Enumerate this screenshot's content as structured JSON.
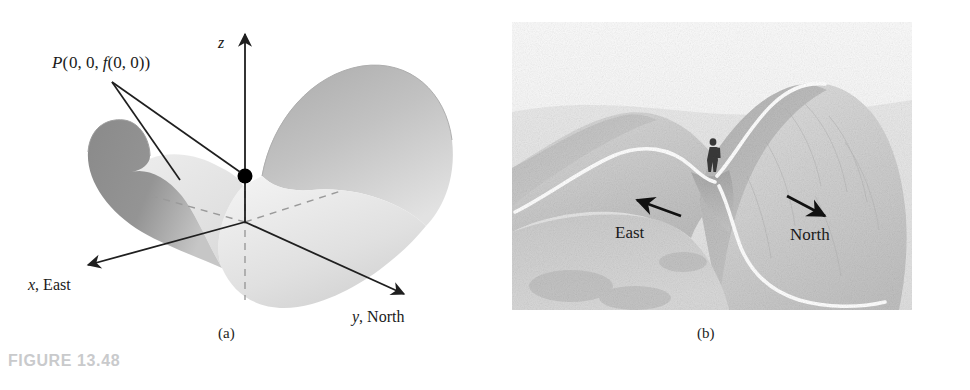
{
  "figure": {
    "caption": "FIGURE 13.48",
    "caption_color": "#c9cacc",
    "background": "#ffffff"
  },
  "panel_a": {
    "sublabel": "(a)",
    "description": "Three-dimensional saddle surface z = f(x, y) drawn over x-y-z axes with the saddle point P marked by a filled black dot.",
    "point_label": {
      "p": "P",
      "open_paren": "(",
      "args": "0, 0,",
      "f": "f",
      "f_args": "(0, 0)",
      "close_paren": ")",
      "full_text": "P(0, 0, f(0, 0))"
    },
    "axes": [
      {
        "name": "z-axis",
        "symbol": "z",
        "suffix": "",
        "direction": "up"
      },
      {
        "name": "x-axis",
        "symbol": "x",
        "suffix": ", East",
        "direction": "down-left"
      },
      {
        "name": "y-axis",
        "symbol": "y",
        "suffix": ", North",
        "direction": "down-right"
      }
    ],
    "surface": {
      "left_lobe_fill": "#8e8e8e",
      "right_lobe_fill": "#b9b9b9",
      "valley_fill": "#e8e8e8",
      "dashed_axis_color": "#9a9a9a",
      "axis_color": "#1f1f1f",
      "point_color": "#000000"
    }
  },
  "panel_b": {
    "sublabel": "(b)",
    "description": "Grayscale pencil rendering of a mountain pass: a saddle between two hills with a hiker standing at the saddle point and white trail curves running along the ridge and valley.",
    "labels": [
      {
        "name": "east-label",
        "text": "East",
        "arrow_direction": "up-left"
      },
      {
        "name": "north-label",
        "text": "North",
        "arrow_direction": "down-right"
      }
    ],
    "colors": {
      "terrain_light": "#e9e9e9",
      "terrain_mid": "#cfcfcf",
      "terrain_dark": "#a9a9a9",
      "trail": "#ffffff",
      "arrow": "#111111",
      "hiker": "#3a3a3a"
    }
  }
}
